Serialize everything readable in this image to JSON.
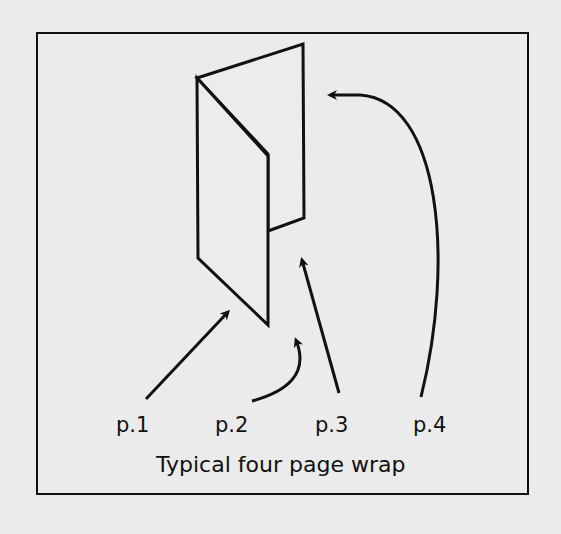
{
  "diagram": {
    "caption": "Typical four page wrap",
    "labels": [
      "p.1",
      "p.2",
      "p.3",
      "p.4"
    ],
    "colors": {
      "background": "#ebebeb",
      "ink": "#111111"
    }
  }
}
